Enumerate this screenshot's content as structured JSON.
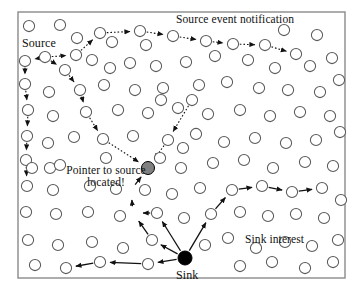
{
  "figure": {
    "kind": "network-diagram",
    "background_color": "#ffffff",
    "frame": {
      "x": 18,
      "y": 12,
      "width": 327,
      "height": 266,
      "stroke": "#8a8a8a",
      "fill": "#ffffff"
    }
  },
  "labels": {
    "source_event_notification": "Source event notification",
    "source": "Source",
    "pointer_to_source": "Pointer to source\nlocated!",
    "sink_interest": "Sink interest",
    "sink": "Sink"
  },
  "style": {
    "node_stroke": "#5a5a5a",
    "node_fill": "#ffffff",
    "node_radius": 5.6,
    "source_node_fill": "#808080",
    "sink_node_fill": "#000000",
    "dotted_edge_color": "#111111",
    "solid_edge_color": "#111111"
  },
  "nodes": [
    {
      "id": "n1",
      "x": 29,
      "y": 26
    },
    {
      "id": "n2",
      "x": 60,
      "y": 25
    },
    {
      "id": "n3",
      "x": 100,
      "y": 33
    },
    {
      "id": "n4",
      "x": 140,
      "y": 31
    },
    {
      "id": "n5",
      "x": 173,
      "y": 36
    },
    {
      "id": "n6",
      "x": 206,
      "y": 41
    },
    {
      "id": "n7",
      "x": 233,
      "y": 44
    },
    {
      "id": "n8",
      "x": 265,
      "y": 45
    },
    {
      "id": "n9",
      "x": 296,
      "y": 54
    },
    {
      "id": "n10",
      "x": 284,
      "y": 30
    },
    {
      "id": "n11",
      "x": 317,
      "y": 35
    },
    {
      "id": "n12",
      "x": 77,
      "y": 38
    },
    {
      "id": "n13",
      "x": 112,
      "y": 42
    },
    {
      "id": "n14",
      "x": 146,
      "y": 45
    },
    {
      "id": "n15",
      "x": 76,
      "y": 55
    },
    {
      "id": "n16",
      "x": 25,
      "y": 61
    },
    {
      "id": "n17",
      "x": 45,
      "y": 57
    },
    {
      "id": "n18",
      "x": 65,
      "y": 70
    },
    {
      "id": "n19",
      "x": 92,
      "y": 60
    },
    {
      "id": "n20",
      "x": 110,
      "y": 68
    },
    {
      "id": "n21",
      "x": 130,
      "y": 63
    },
    {
      "id": "n22",
      "x": 156,
      "y": 66
    },
    {
      "id": "n23",
      "x": 186,
      "y": 62
    },
    {
      "id": "n24",
      "x": 215,
      "y": 56
    },
    {
      "id": "n25",
      "x": 248,
      "y": 60
    },
    {
      "id": "n26",
      "x": 275,
      "y": 68
    },
    {
      "id": "n27",
      "x": 310,
      "y": 66
    },
    {
      "id": "n28",
      "x": 332,
      "y": 58
    },
    {
      "id": "n29",
      "x": 25,
      "y": 84
    },
    {
      "id": "n30",
      "x": 49,
      "y": 92
    },
    {
      "id": "n31",
      "x": 80,
      "y": 90
    },
    {
      "id": "n32",
      "x": 104,
      "y": 85
    },
    {
      "id": "n33",
      "x": 135,
      "y": 90
    },
    {
      "id": "n34",
      "x": 163,
      "y": 88
    },
    {
      "id": "n35",
      "x": 199,
      "y": 85
    },
    {
      "id": "n36",
      "x": 227,
      "y": 82
    },
    {
      "id": "n37",
      "x": 259,
      "y": 88
    },
    {
      "id": "n38",
      "x": 288,
      "y": 90
    },
    {
      "id": "n39",
      "x": 320,
      "y": 92
    },
    {
      "id": "n40",
      "x": 339,
      "y": 80
    },
    {
      "id": "n41",
      "x": 28,
      "y": 110
    },
    {
      "id": "n42",
      "x": 53,
      "y": 116
    },
    {
      "id": "n43",
      "x": 86,
      "y": 112
    },
    {
      "id": "n44",
      "x": 118,
      "y": 110
    },
    {
      "id": "n45",
      "x": 148,
      "y": 113
    },
    {
      "id": "n46",
      "x": 178,
      "y": 108
    },
    {
      "id": "n47",
      "x": 208,
      "y": 114
    },
    {
      "id": "n48",
      "x": 240,
      "y": 110
    },
    {
      "id": "n49",
      "x": 270,
      "y": 116
    },
    {
      "id": "n50",
      "x": 300,
      "y": 112
    },
    {
      "id": "n51",
      "x": 330,
      "y": 116
    },
    {
      "id": "n52",
      "x": 27,
      "y": 136
    },
    {
      "id": "n53",
      "x": 48,
      "y": 143
    },
    {
      "id": "n54",
      "x": 74,
      "y": 137
    },
    {
      "id": "n55",
      "x": 103,
      "y": 139
    },
    {
      "id": "n56",
      "x": 133,
      "y": 136
    },
    {
      "id": "n57",
      "x": 168,
      "y": 140
    },
    {
      "id": "n58",
      "x": 196,
      "y": 134
    },
    {
      "id": "n59",
      "x": 224,
      "y": 142
    },
    {
      "id": "n60",
      "x": 255,
      "y": 138
    },
    {
      "id": "n61",
      "x": 286,
      "y": 143
    },
    {
      "id": "n62",
      "x": 316,
      "y": 140
    },
    {
      "id": "n63",
      "x": 340,
      "y": 132
    },
    {
      "id": "n64",
      "x": 26,
      "y": 160
    },
    {
      "id": "n65",
      "x": 50,
      "y": 168
    },
    {
      "id": "n66",
      "x": 106,
      "y": 158
    },
    {
      "id": "n67",
      "x": 160,
      "y": 158
    },
    {
      "id": "n68",
      "x": 183,
      "y": 148
    },
    {
      "id": "n69",
      "x": 181,
      "y": 168
    },
    {
      "id": "n70",
      "x": 213,
      "y": 163
    },
    {
      "id": "n71",
      "x": 244,
      "y": 160
    },
    {
      "id": "n72",
      "x": 273,
      "y": 168
    },
    {
      "id": "n73",
      "x": 305,
      "y": 162
    },
    {
      "id": "n74",
      "x": 333,
      "y": 166
    },
    {
      "id": "n75",
      "x": 27,
      "y": 186
    },
    {
      "id": "n76",
      "x": 53,
      "y": 190
    },
    {
      "id": "n77",
      "x": 90,
      "y": 186
    },
    {
      "id": "n78",
      "x": 116,
      "y": 189
    },
    {
      "id": "n79",
      "x": 145,
      "y": 190
    },
    {
      "id": "n80",
      "x": 172,
      "y": 194
    },
    {
      "id": "n81",
      "x": 200,
      "y": 188
    },
    {
      "id": "n82",
      "x": 232,
      "y": 190
    },
    {
      "id": "n83",
      "x": 262,
      "y": 186
    },
    {
      "id": "n84",
      "x": 292,
      "y": 192
    },
    {
      "id": "n85",
      "x": 322,
      "y": 188
    },
    {
      "id": "n86",
      "x": 341,
      "y": 200
    },
    {
      "id": "n87",
      "x": 26,
      "y": 212
    },
    {
      "id": "n88",
      "x": 56,
      "y": 214
    },
    {
      "id": "n89",
      "x": 88,
      "y": 212
    },
    {
      "id": "n90",
      "x": 120,
      "y": 216
    },
    {
      "id": "n91",
      "x": 157,
      "y": 213
    },
    {
      "id": "n92",
      "x": 184,
      "y": 218
    },
    {
      "id": "n93",
      "x": 211,
      "y": 214
    },
    {
      "id": "n94",
      "x": 240,
      "y": 212
    },
    {
      "id": "n95",
      "x": 268,
      "y": 216
    },
    {
      "id": "n96",
      "x": 296,
      "y": 214
    },
    {
      "id": "n97",
      "x": 324,
      "y": 218
    },
    {
      "id": "n98",
      "x": 28,
      "y": 240
    },
    {
      "id": "n99",
      "x": 58,
      "y": 245
    },
    {
      "id": "n100",
      "x": 92,
      "y": 242
    },
    {
      "id": "n101",
      "x": 123,
      "y": 248
    },
    {
      "id": "n102",
      "x": 152,
      "y": 240
    },
    {
      "id": "n103",
      "x": 205,
      "y": 245
    },
    {
      "id": "n104",
      "x": 228,
      "y": 238
    },
    {
      "id": "n105",
      "x": 256,
      "y": 248
    },
    {
      "id": "n106",
      "x": 285,
      "y": 242
    },
    {
      "id": "n107",
      "x": 312,
      "y": 246
    },
    {
      "id": "n108",
      "x": 338,
      "y": 240
    },
    {
      "id": "n109",
      "x": 35,
      "y": 265
    },
    {
      "id": "n110",
      "x": 66,
      "y": 268
    },
    {
      "id": "n111",
      "x": 100,
      "y": 262
    },
    {
      "id": "n112",
      "x": 148,
      "y": 264
    },
    {
      "id": "n113",
      "x": 240,
      "y": 266
    },
    {
      "id": "n114",
      "x": 272,
      "y": 262
    },
    {
      "id": "n115",
      "x": 305,
      "y": 268
    },
    {
      "id": "n116",
      "x": 333,
      "y": 262
    },
    {
      "id": "n117",
      "x": 161,
      "y": 100
    },
    {
      "id": "n118",
      "x": 192,
      "y": 100
    },
    {
      "id": "n119",
      "x": 60,
      "y": 165
    },
    {
      "id": "n120",
      "x": 32,
      "y": 168
    }
  ],
  "special_nodes": [
    {
      "id": "pointer",
      "x": 148,
      "y": 168,
      "role": "pointer-to-source",
      "fill": "#808080",
      "radius": 6.5
    },
    {
      "id": "sink",
      "x": 185,
      "y": 258,
      "role": "sink",
      "fill": "#000000",
      "radius": 7.0
    }
  ],
  "dotted_paths": [
    {
      "name": "source-notification-north",
      "points": [
        [
          45,
          57
        ],
        [
          76,
          55
        ],
        [
          100,
          33
        ],
        [
          140,
          31
        ],
        [
          173,
          36
        ],
        [
          206,
          41
        ],
        [
          233,
          44
        ],
        [
          265,
          45
        ],
        [
          296,
          54
        ]
      ]
    },
    {
      "name": "source-branch-down",
      "points": [
        [
          45,
          57
        ],
        [
          25,
          61
        ],
        [
          25,
          84
        ],
        [
          28,
          110
        ],
        [
          27,
          136
        ],
        [
          26,
          160
        ],
        [
          27,
          186
        ]
      ]
    },
    {
      "name": "source-branch-to-pointer",
      "points": [
        [
          45,
          57
        ],
        [
          65,
          70
        ],
        [
          80,
          90
        ],
        [
          86,
          112
        ],
        [
          103,
          139
        ],
        [
          148,
          168
        ]
      ]
    },
    {
      "name": "east-to-pointer",
      "points": [
        [
          192,
          100
        ],
        [
          168,
          140
        ],
        [
          148,
          168
        ]
      ]
    }
  ],
  "solid_paths": [
    {
      "name": "sink-to-pointer",
      "points": [
        [
          185,
          258
        ],
        [
          152,
          240
        ],
        [
          133,
          213
        ],
        [
          131,
          190
        ],
        [
          148,
          168
        ]
      ]
    },
    {
      "name": "sink-west",
      "points": [
        [
          185,
          258
        ],
        [
          148,
          264
        ],
        [
          100,
          262
        ],
        [
          66,
          268
        ]
      ]
    },
    {
      "name": "sink-northwest",
      "points": [
        [
          185,
          258
        ],
        [
          157,
          213
        ],
        [
          133,
          213
        ]
      ]
    },
    {
      "name": "sink-interest-east",
      "points": [
        [
          185,
          258
        ],
        [
          211,
          214
        ],
        [
          232,
          190
        ],
        [
          262,
          186
        ],
        [
          292,
          192
        ],
        [
          322,
          188
        ]
      ]
    }
  ],
  "arrow_markers": {
    "dotted_arrow": "filled-triangle",
    "solid_arrow": "filled-triangle"
  }
}
